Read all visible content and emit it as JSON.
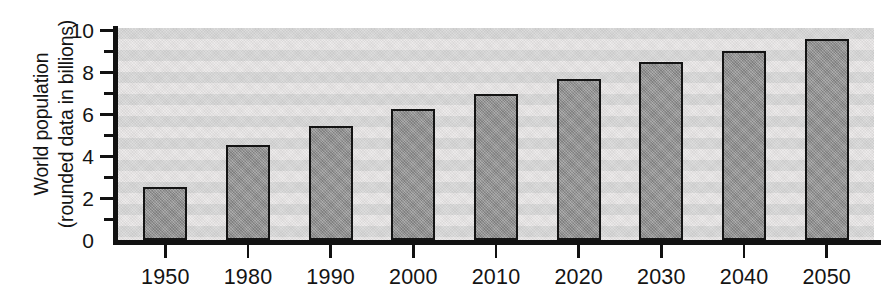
{
  "chart_data": {
    "type": "bar",
    "title": "",
    "xlabel": "",
    "ylabel": "World population (rounded data in billions)",
    "ylabel_lines": [
      "World population",
      "(rounded data in billions)"
    ],
    "categories": [
      "1950",
      "1980",
      "1990",
      "2000",
      "2010",
      "2020",
      "2030",
      "2040",
      "2050"
    ],
    "values": [
      2.5,
      4.5,
      5.4,
      6.2,
      6.9,
      7.6,
      8.4,
      8.9,
      9.5
    ],
    "ylim": [
      0,
      10
    ],
    "y_major_ticks": [
      0,
      2,
      4,
      6,
      8,
      10
    ],
    "y_minor_ticks": [
      1,
      3,
      5,
      7,
      9
    ],
    "y_tick_labels": [
      "0",
      "2",
      "4",
      "6",
      "8",
      "10"
    ],
    "grid": false,
    "background_bands": true,
    "legend": "none",
    "colors": {
      "bar_fill": "#999999",
      "bar_stroke": "#141414",
      "axis": "#111111",
      "plot_band_light": "#eceaea",
      "plot_band_dark": "#dcdcdc",
      "text": "#141414",
      "page_background": "#ffffff"
    }
  }
}
